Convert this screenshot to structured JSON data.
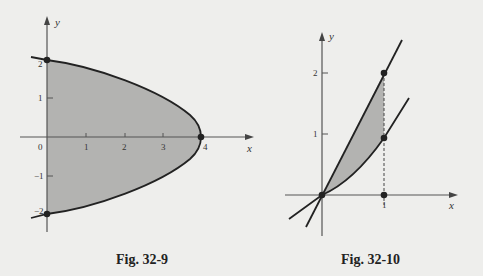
{
  "figures": [
    {
      "caption": "Fig. 32-9",
      "axes": {
        "x_label": "x",
        "y_label": "y"
      },
      "x_ticks": [
        "0",
        "1",
        "2",
        "3",
        "4"
      ],
      "y_ticks": [
        "2",
        "1",
        "−1",
        "−2"
      ],
      "points": [
        {
          "x": 0,
          "y": 2
        },
        {
          "x": 4,
          "y": 0
        },
        {
          "x": 0,
          "y": -2
        }
      ],
      "shaded_region": "between parabola x = 4 - y^2 and the y-axis"
    },
    {
      "caption": "Fig. 32-10",
      "axes": {
        "x_label": "x",
        "y_label": "y"
      },
      "x_ticks": [
        "1"
      ],
      "y_ticks": [
        "2",
        "1"
      ],
      "points": [
        {
          "x": 0,
          "y": 0
        },
        {
          "x": 1,
          "y": 2
        },
        {
          "x": 1,
          "y": 1
        },
        {
          "x": 1,
          "y": 0
        }
      ],
      "shaded_region": "between line y = 2x and lower curve from x = 0 to x = 1"
    }
  ],
  "colors": {
    "background": "#eeeeec",
    "shade": "#b3b3b1",
    "ink": "#222222",
    "axis": "#555555"
  }
}
